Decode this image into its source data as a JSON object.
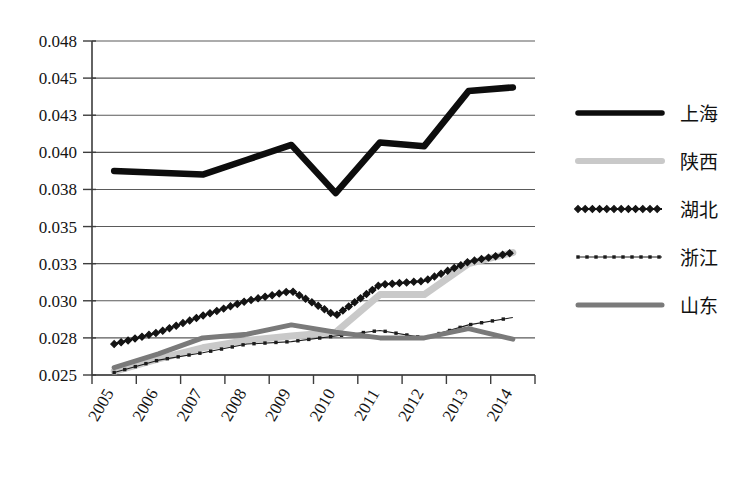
{
  "chart_data": {
    "type": "line",
    "title": "",
    "xlabel": "",
    "ylabel": "",
    "categories": [
      "2005",
      "2006",
      "2007",
      "2008",
      "2009",
      "2010",
      "2011",
      "2012",
      "2013",
      "2014"
    ],
    "ytick_labels": [
      "0.048",
      "0.045",
      "0.043",
      "0.040",
      "0.038",
      "0.035",
      "0.033",
      "0.030",
      "0.028",
      "0.025"
    ],
    "ytick_values": [
      0.048,
      0.045,
      0.043,
      0.04,
      0.038,
      0.035,
      0.033,
      0.03,
      0.028,
      0.025
    ],
    "ylim": [
      0.025,
      0.048
    ],
    "grid": true,
    "legend_position": "right",
    "series": [
      {
        "name": "上海",
        "style": "thick-solid-black",
        "color": "#0d0d0d",
        "values": [
          0.039,
          0.0389,
          0.0388,
          0.0396,
          0.0406,
          0.0377,
          0.0408,
          0.0405,
          0.0443,
          0.0445
        ]
      },
      {
        "name": "陕西",
        "style": "thick-solid-lightgray",
        "color": "#c9c9c9",
        "values": [
          0.0253,
          0.0263,
          0.0272,
          0.0278,
          0.0281,
          0.0283,
          0.0305,
          0.0305,
          0.033,
          0.0336
        ]
      },
      {
        "name": "湖北",
        "style": "marker-zigzag-black",
        "color": "#141414",
        "values": [
          0.0275,
          0.0283,
          0.0292,
          0.03,
          0.0308,
          0.0292,
          0.0313,
          0.0316,
          0.0331,
          0.0336
        ]
      },
      {
        "name": "浙江",
        "style": "thin-dotted-black",
        "color": "#1c1c1c",
        "values": [
          0.0252,
          0.0262,
          0.0268,
          0.0275,
          0.0277,
          0.0281,
          0.0284,
          0.028,
          0.0287,
          0.0291
        ]
      },
      {
        "name": "山东",
        "style": "medium-solid-darkgray",
        "color": "#7a7a7a",
        "values": [
          0.0256,
          0.0267,
          0.028,
          0.0282,
          0.0287,
          0.0283,
          0.028,
          0.028,
          0.0285,
          0.0279
        ]
      }
    ]
  },
  "legend": {
    "items": [
      {
        "label": "上海"
      },
      {
        "label": "陕西"
      },
      {
        "label": "湖北"
      },
      {
        "label": "浙江"
      },
      {
        "label": "山东"
      }
    ]
  }
}
